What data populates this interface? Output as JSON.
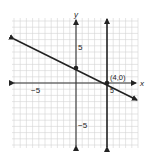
{
  "chart_data": {
    "type": "line",
    "title": "",
    "xlabel": "x",
    "ylabel": "y",
    "xlim": [
      -10,
      10
    ],
    "ylim": [
      -10,
      10
    ],
    "grid": true,
    "tick_labels": {
      "x": [
        {
          "value": -5,
          "label": "−5"
        },
        {
          "value": 5,
          "label": "5"
        }
      ],
      "y": [
        {
          "value": 5,
          "label": "5"
        },
        {
          "value": -5,
          "label": "−5"
        }
      ]
    },
    "series": [
      {
        "name": "slanted line",
        "equation": "y = -x/2 + 2",
        "points": [
          [
            -10,
            7
          ],
          [
            0,
            2
          ],
          [
            4,
            0
          ],
          [
            10,
            -3
          ]
        ],
        "arrows": "both"
      },
      {
        "name": "vertical line",
        "equation": "x = 4",
        "points": [
          [
            4,
            -10
          ],
          [
            4,
            10
          ]
        ],
        "arrows": "both"
      }
    ],
    "marked_points": [
      {
        "x": 0,
        "y": 2,
        "label": ""
      },
      {
        "x": 4,
        "y": 0,
        "label": "(4,0)"
      }
    ],
    "annotations": [
      "(4,0)"
    ]
  },
  "labels": {
    "x_axis": "x",
    "y_axis": "y",
    "x_neg5": "−5",
    "x_pos5": "5",
    "y_pos5": "5",
    "y_neg5": "−5",
    "point_label": "(4,0)"
  },
  "colors": {
    "grid": "#d4d4d4",
    "axis": "#333333",
    "line": "#222222"
  }
}
